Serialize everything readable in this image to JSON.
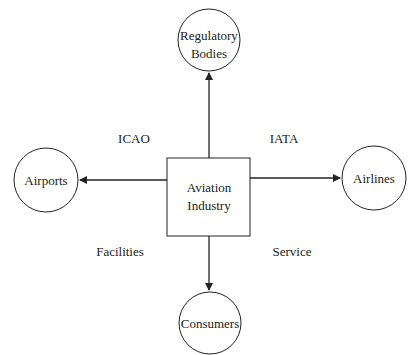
{
  "diagram": {
    "center": {
      "line1": "Aviation",
      "line2": "Industry"
    },
    "nodes": {
      "top": {
        "line1": "Regulatory",
        "line2": "Bodies"
      },
      "left": {
        "label": "Airports"
      },
      "right": {
        "label": "Airlines"
      },
      "bottom": {
        "label": "Consumers"
      }
    },
    "quadrant_labels": {
      "top_left": "ICAO",
      "top_right": "IATA",
      "bottom_left": "Facilities",
      "bottom_right": "Service"
    },
    "colors": {
      "stroke": "#222222",
      "background": "#ffffff"
    }
  }
}
